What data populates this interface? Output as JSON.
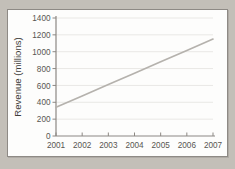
{
  "chart_data": {
    "type": "line",
    "title": "",
    "xlabel": "",
    "ylabel": "Revenue (millions)",
    "categories": [
      "2001",
      "2002",
      "2003",
      "2004",
      "2005",
      "2006",
      "2007"
    ],
    "x": [
      2001,
      2002,
      2003,
      2004,
      2005,
      2006,
      2007
    ],
    "series": [
      {
        "name": "Revenue",
        "color": "#b5b2ad",
        "values": [
          340,
          475,
          610,
          745,
          880,
          1015,
          1150
        ]
      }
    ],
    "xlim": [
      2001,
      2007
    ],
    "ylim": [
      0,
      1400
    ],
    "ytick_labels": [
      "0",
      "200",
      "400",
      "600",
      "800",
      "1000",
      "1200",
      "1400"
    ],
    "yticks": [
      0,
      200,
      400,
      600,
      800,
      1000,
      1200,
      1400
    ],
    "xtick_labels": [
      "2001",
      "2002",
      "2003",
      "2004",
      "2005",
      "2006",
      "2007"
    ],
    "grid": true,
    "grid_axis": "y",
    "legend": false,
    "legend_position": "none",
    "background": "#fdfdfc",
    "axis_color": "#8c8883"
  }
}
